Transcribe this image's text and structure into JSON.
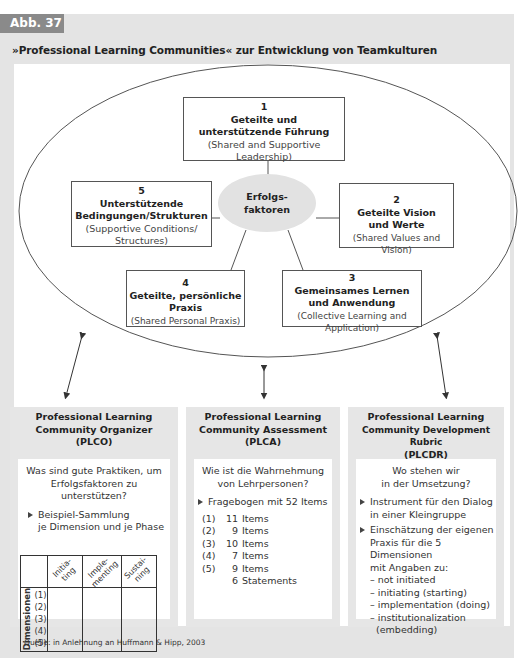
{
  "figure": {
    "badge": "Abb. 37",
    "title": "»Professional Learning Communities« zur Entwicklung  von Teamkulturen",
    "source": "Quelle: in Anlehnung an Huffmann & Hipp, 2003"
  },
  "center_node": {
    "line1": "Erfolgs-",
    "line2": "faktoren"
  },
  "dimensions": [
    {
      "num": "1",
      "de1": "Geteilte und",
      "de2": "unterstützende Führung",
      "en1": "(Shared and Supportive",
      "en2": "Leadership)"
    },
    {
      "num": "2",
      "de1": "Geteilte Vision",
      "de2": "und Werte",
      "en1": "(Shared Values and Vision)",
      "en2": ""
    },
    {
      "num": "3",
      "de1": "Gemeinsames Lernen",
      "de2": "und Anwendung",
      "en1": "(Collective Learning and",
      "en2": "Application)"
    },
    {
      "num": "4",
      "de1": "Geteilte, persönliche",
      "de2": "Praxis",
      "en1": "(Shared Personal Praxis)",
      "en2": ""
    },
    {
      "num": "5",
      "de1": "Unterstützende",
      "de2": "Bedingungen/Strukturen",
      "en1": "(Supportive Conditions/",
      "en2": "Structures)"
    }
  ],
  "panels": {
    "plco": {
      "title1": "Professional Learning",
      "title2": "Community Organizer",
      "title3": "(PLCO)",
      "question1": "Was sind gute Praktiken, um",
      "question2": "Erfolgsfaktoren zu unterstützen?",
      "bullet1": "Beispiel-Sammlung",
      "bullet2": "je Dimension und je Phase",
      "table": {
        "phases": [
          "Initia-\nting",
          "Imple-\nmenting",
          "Sustai-\nning"
        ],
        "phase_lines": [
          [
            "Initia-",
            "ting"
          ],
          [
            "Imple-",
            "menting"
          ],
          [
            "Sustai-",
            "ning"
          ]
        ],
        "row_label": "Dimensionen",
        "rows": [
          "(1)",
          "(2)",
          "(3)",
          "(4)",
          "(5)"
        ]
      }
    },
    "plca": {
      "title1": "Professional Learning",
      "title2": "Community Assessment",
      "title3": "(PLCA)",
      "question1": "Wie ist die Wahrnehmung",
      "question2": "von Lehrpersonen?",
      "bullet": "Fragebogen mit 52 Items",
      "items": [
        {
          "key": "(1)",
          "count": "11",
          "label": "Items"
        },
        {
          "key": "(2)",
          "count": "9",
          "label": "Items"
        },
        {
          "key": "(3)",
          "count": "10",
          "label": "Items"
        },
        {
          "key": "(4)",
          "count": "7",
          "label": "Items"
        },
        {
          "key": "(5)",
          "count": "9",
          "label": "Items"
        },
        {
          "key": "",
          "count": "6",
          "label": "Statements"
        }
      ]
    },
    "plcdr": {
      "title1": "Professional Learning",
      "title2": "Community Development Rubric",
      "title3": "(PLCDR)",
      "question1": "Wo stehen wir",
      "question2": "in der Umsetzung?",
      "bullet1_l1": "Instrument für den Dialog",
      "bullet1_l2": "in einer Kleingruppe",
      "bullet2_l1": "Einschätzung der eigenen",
      "bullet2_l2": "Praxis für die 5 Dimensionen",
      "bullet2_l3": "mit Angaben zu:",
      "levels": [
        "– not initiated",
        "– initiating (starting)",
        "– implementation (doing)",
        "– institutionalization",
        "  (embedding)"
      ]
    }
  },
  "colors": {
    "frame": "#e4e4e4",
    "badge": "#8a8a8a",
    "center_node": "#e2e2e2",
    "panel": "#e6e6e6",
    "line": "#555555"
  }
}
